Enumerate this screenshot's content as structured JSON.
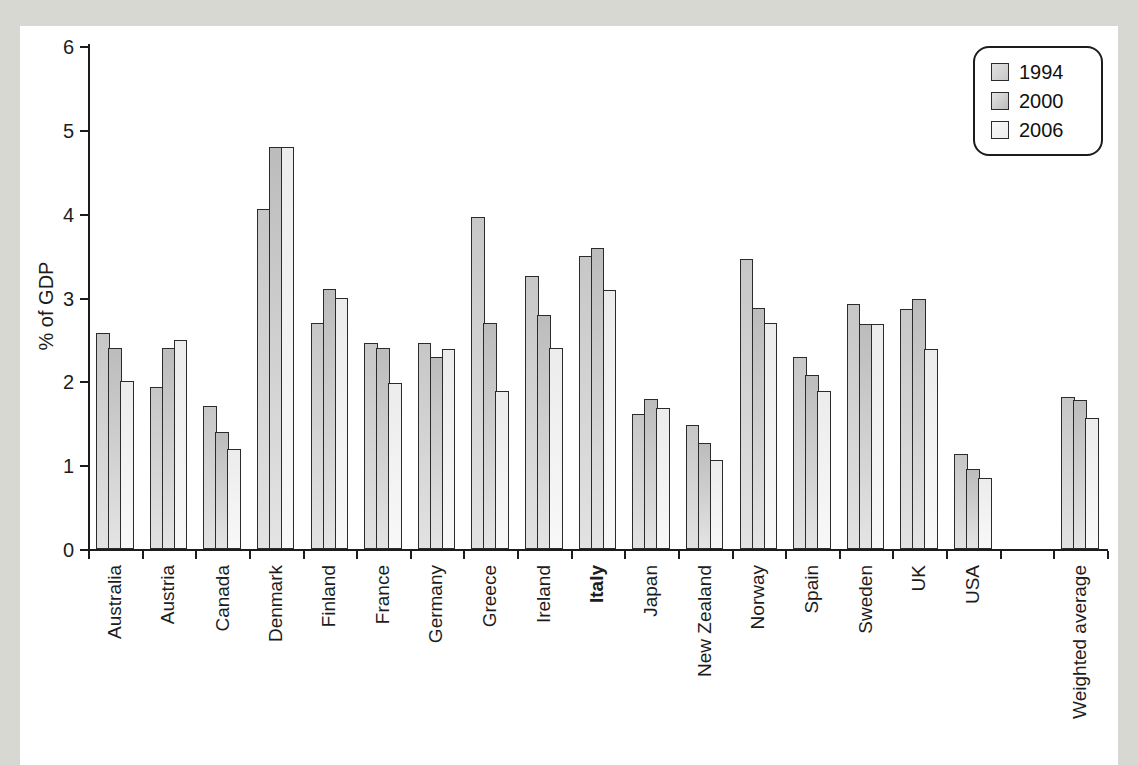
{
  "colors": {
    "page_bg": "#d8d8d3",
    "panel_bg": "#ffffff",
    "axis": "#1c1c1c",
    "bar_border": "#2b2b2b"
  },
  "chart_data": {
    "type": "bar",
    "title": "",
    "xlabel": "",
    "ylabel": "% of GDP",
    "ylim": [
      0,
      6
    ],
    "yticks": [
      0,
      1,
      2,
      3,
      4,
      5,
      6
    ],
    "grid": "off",
    "legend_position": "top-right",
    "bold_category": "Italy",
    "gap_before_category": "Weighted average",
    "categories": [
      "Australia",
      "Austria",
      "Canada",
      "Denmark",
      "Finland",
      "France",
      "Germany",
      "Greece",
      "Ireland",
      "Italy",
      "Japan",
      "New Zealand",
      "Norway",
      "Spain",
      "Sweden",
      "UK",
      "USA",
      "Weighted average"
    ],
    "series": [
      {
        "name": "1994",
        "values": [
          2.58,
          1.93,
          1.7,
          4.06,
          2.69,
          2.46,
          2.46,
          3.96,
          3.26,
          3.49,
          1.61,
          1.48,
          3.46,
          2.29,
          2.92,
          2.86,
          1.13,
          1.81
        ]
      },
      {
        "name": "2000",
        "values": [
          2.4,
          2.4,
          1.39,
          4.79,
          3.1,
          2.4,
          2.29,
          2.69,
          2.79,
          3.59,
          1.79,
          1.27,
          2.88,
          2.08,
          2.68,
          2.98,
          0.96,
          1.78
        ]
      },
      {
        "name": "2006",
        "values": [
          2.0,
          2.49,
          1.19,
          4.79,
          3.0,
          1.98,
          2.39,
          1.89,
          2.4,
          3.09,
          1.68,
          1.06,
          2.69,
          1.88,
          2.68,
          2.38,
          0.85,
          1.56
        ]
      }
    ],
    "series_colors": [
      {
        "from": "#c7c7c7",
        "to": "#e2e2e2"
      },
      {
        "from": "#bcbcbc",
        "to": "#e4e4e4"
      },
      {
        "from": "#ececec",
        "to": "#f8f8f8"
      }
    ]
  }
}
